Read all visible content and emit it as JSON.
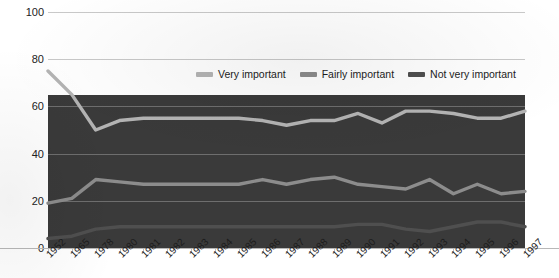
{
  "chart_data": {
    "type": "line",
    "title": "",
    "xlabel": "",
    "ylabel": "",
    "ylim": [
      0,
      100
    ],
    "yticks": [
      0,
      20,
      40,
      60,
      80,
      100
    ],
    "grid": true,
    "legend_position": "top-center",
    "categories": [
      "1952",
      "1965",
      "1978",
      "1980",
      "1981",
      "1982",
      "1983",
      "1984",
      "1985",
      "1986",
      "1987",
      "1988",
      "1989",
      "1990",
      "1991",
      "1992",
      "1993",
      "1994",
      "1995",
      "1996",
      "1997"
    ],
    "series": [
      {
        "name": "Very important",
        "color": "#b4b4b4",
        "values": [
          75,
          65,
          50,
          54,
          55,
          55,
          55,
          55,
          55,
          54,
          52,
          54,
          54,
          57,
          53,
          58,
          58,
          57,
          55,
          55,
          58
        ]
      },
      {
        "name": "Fairly important",
        "color": "#8c8c8c",
        "values": [
          19,
          21,
          29,
          28,
          27,
          27,
          27,
          27,
          27,
          29,
          27,
          29,
          30,
          27,
          26,
          25,
          29,
          23,
          27,
          23,
          24
        ]
      },
      {
        "name": "Not very important",
        "color": "#4f4f4f",
        "values": [
          4,
          5,
          8,
          9,
          9,
          9,
          9,
          9,
          9,
          9,
          9,
          9,
          9,
          10,
          10,
          8,
          7,
          9,
          11,
          11,
          9
        ]
      }
    ]
  },
  "axis": {
    "y_ticks": [
      "0",
      "20",
      "40",
      "60",
      "80",
      "100"
    ]
  },
  "legend": {
    "items": [
      {
        "label": "Very important"
      },
      {
        "label": "Fairly important"
      },
      {
        "label": "Not very important"
      }
    ]
  },
  "colors": {
    "band": "#3a3a3a",
    "gridline": "#c9c9c9",
    "band_gridline": "#6e6e6e",
    "text": "#1c1c1c"
  }
}
